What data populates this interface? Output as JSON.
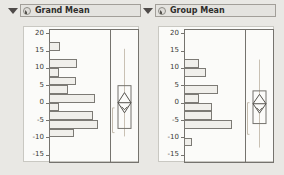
{
  "panels": [
    {
      "title": "Grand Mean"
    },
    {
      "title": "Group Mean"
    }
  ],
  "icons": {
    "disclosure": "triangle-down",
    "collapse_button": "circle-with-dash"
  },
  "colors": {
    "page_bg": "#e9e8e4",
    "titlebar_bg": "#e4e3df",
    "content_bg": "#fbfbf9",
    "frame_border": "#75736e",
    "bar_fill": "#f0efeb",
    "bar_border": "#7c7a75",
    "whisker": "#c9c1b4",
    "bracket": "#c3bbae",
    "diamond_stroke": "#55534e",
    "text": "#2e2d2b"
  },
  "chart_data": [
    {
      "type": "bar",
      "subtype": "horizontal-histogram-with-boxplot",
      "title": "Grand Mean",
      "ylabel": "",
      "xlabel": "",
      "axis_ticks": [
        20,
        15,
        10,
        5,
        0,
        -5,
        -10,
        -15
      ],
      "ylim": [
        -17.5,
        21
      ],
      "bin_width": 2.5,
      "bins": [
        {
          "bin_top": 17.5,
          "count": 1,
          "len_px": 11
        },
        {
          "bin_top": 12.5,
          "count": 3,
          "len_px": 28
        },
        {
          "bin_top": 10.0,
          "count": 1,
          "len_px": 9.5
        },
        {
          "bin_top": 7.5,
          "count": 3,
          "len_px": 27
        },
        {
          "bin_top": 5.0,
          "count": 2,
          "len_px": 19
        },
        {
          "bin_top": 2.5,
          "count": 5,
          "len_px": 46
        },
        {
          "bin_top": 0.0,
          "count": 1,
          "len_px": 10
        },
        {
          "bin_top": -2.5,
          "count": 5,
          "len_px": 44
        },
        {
          "bin_top": -5.0,
          "count": 6,
          "len_px": 49
        },
        {
          "bin_top": -7.5,
          "count": 3,
          "len_px": 25
        }
      ],
      "boxplot": {
        "q1": -7.4,
        "q3": 4.9,
        "mean": 0,
        "ci_half": 2.9,
        "whisker_high": 15.5,
        "whisker_low": -9.7,
        "bracket_high": -1.5,
        "bracket_low": -8.6
      }
    },
    {
      "type": "bar",
      "subtype": "horizontal-histogram-with-boxplot",
      "title": "Group Mean",
      "ylabel": "",
      "xlabel": "",
      "axis_ticks": [
        20,
        15,
        10,
        5,
        0,
        -5,
        -10,
        -15
      ],
      "ylim": [
        -17.5,
        21
      ],
      "bin_width": 2.5,
      "bins": [
        {
          "bin_top": 12.5,
          "count": 2,
          "len_px": 15
        },
        {
          "bin_top": 10.0,
          "count": 3,
          "len_px": 21.5
        },
        {
          "bin_top": 5.0,
          "count": 4,
          "len_px": 34
        },
        {
          "bin_top": 2.5,
          "count": 2,
          "len_px": 14.5
        },
        {
          "bin_top": 0.0,
          "count": 4,
          "len_px": 27.5
        },
        {
          "bin_top": -2.5,
          "count": 4,
          "len_px": 27.5
        },
        {
          "bin_top": -5.0,
          "count": 6,
          "len_px": 47.5
        },
        {
          "bin_top": -10.0,
          "count": 1,
          "len_px": 7.5
        }
      ],
      "boxplot": {
        "q1": -6.0,
        "q3": 3.4,
        "mean": -0.3,
        "ci_half": 2.7,
        "whisker_high": 12.4,
        "whisker_low": -12.9,
        "bracket_high": 0,
        "bracket_low": -9.1
      }
    }
  ]
}
